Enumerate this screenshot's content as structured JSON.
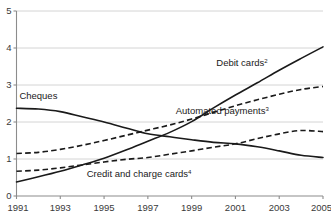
{
  "chart_data": {
    "type": "line",
    "title": "",
    "subtitle": "",
    "xlabel": "",
    "ylabel": "",
    "xlim": [
      1991,
      2005
    ],
    "ylim": [
      0,
      5
    ],
    "grid": true,
    "legend_position": "inline-annotations",
    "x": [
      1991,
      1992,
      1993,
      1994,
      1995,
      1996,
      1997,
      1998,
      1999,
      2000,
      2001,
      2002,
      2003,
      2004,
      2005
    ],
    "y_ticks": [
      "0",
      "1",
      "2",
      "3",
      "4",
      "5"
    ],
    "x_ticks": [
      "1991",
      "1993",
      "1995",
      "1997",
      "1999",
      "2001",
      "2003",
      "2005"
    ],
    "series": [
      {
        "name": "Cheques",
        "label": "Cheques",
        "superscript": "",
        "style": "solid",
        "color": "#1a1a1a",
        "label_x": 1992.0,
        "label_y": 2.62,
        "values": [
          2.37,
          2.35,
          2.28,
          2.14,
          2.0,
          1.84,
          1.68,
          1.6,
          1.52,
          1.45,
          1.41,
          1.33,
          1.22,
          1.1,
          1.04
        ]
      },
      {
        "name": "Debit cards",
        "label": "Debit cards",
        "superscript": "2",
        "style": "solid",
        "color": "#1a1a1a",
        "label_x": 2001.3,
        "label_y": 3.52,
        "values": [
          0.38,
          0.52,
          0.67,
          0.84,
          1.02,
          1.24,
          1.48,
          1.72,
          2.01,
          2.38,
          2.73,
          3.06,
          3.4,
          3.72,
          4.03
        ]
      },
      {
        "name": "Automated payments",
        "label": "Automated payments",
        "superscript": "3",
        "style": "dashed",
        "color": "#1a1a1a",
        "label_x": 2000.4,
        "label_y": 2.22,
        "values": [
          1.15,
          1.18,
          1.26,
          1.37,
          1.5,
          1.64,
          1.78,
          1.92,
          2.08,
          2.26,
          2.44,
          2.6,
          2.75,
          2.88,
          2.96
        ]
      },
      {
        "name": "Credit and charge cards",
        "label": "Credit and charge cards",
        "superscript": "4",
        "style": "dashed",
        "color": "#1a1a1a",
        "label_x": 1996.6,
        "label_y": 0.52,
        "values": [
          0.67,
          0.7,
          0.76,
          0.84,
          0.92,
          0.99,
          1.04,
          1.13,
          1.22,
          1.32,
          1.41,
          1.55,
          1.68,
          1.77,
          1.74
        ]
      }
    ]
  },
  "colors": {
    "series_stroke": "#1a1a1a",
    "gridline": "#c9c9c9",
    "axis": "#8c8c8c",
    "tick_text": "#3a3a3a",
    "background": "#ffffff"
  }
}
